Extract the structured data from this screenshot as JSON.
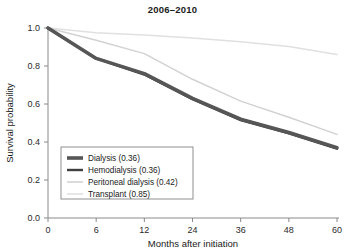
{
  "chart_data": {
    "type": "line",
    "title": "2006–2010",
    "xlabel": "Months after initiation",
    "ylabel": "Survival probability",
    "x": [
      0,
      6,
      12,
      24,
      36,
      48,
      60
    ],
    "xticklabels": [
      "0",
      "6",
      "12",
      "24",
      "36",
      "48",
      "60"
    ],
    "yticklabels": [
      "0.0",
      "0.2",
      "0.4",
      "0.6",
      "0.8",
      "1.0"
    ],
    "yticks": [
      0.0,
      0.2,
      0.4,
      0.6,
      0.8,
      1.0
    ],
    "ylim": [
      0.0,
      1.0
    ],
    "xlim": [
      0,
      60
    ],
    "x_axis_scale": "categorical-even-spacing",
    "grid": false,
    "legend_position": "lower-left-inside",
    "series": [
      {
        "name": "Dialysis",
        "final_value": 0.36,
        "legend_label": "Dialysis (0.36)",
        "color": "#565656",
        "width": 3.6,
        "values": [
          1.0,
          0.84,
          0.76,
          0.63,
          0.52,
          0.45,
          0.37
        ]
      },
      {
        "name": "Hemodialysis",
        "final_value": 0.36,
        "legend_label": "Hemodialysis (0.36)",
        "color": "#3f3f3f",
        "width": 2.4,
        "values": [
          1.0,
          0.84,
          0.755,
          0.625,
          0.515,
          0.445,
          0.365
        ]
      },
      {
        "name": "Peritoneal dialysis",
        "final_value": 0.42,
        "legend_label": "Peritoneal dialysis (0.42)",
        "color": "#d2d2d2",
        "width": 1.5,
        "values": [
          1.0,
          0.935,
          0.865,
          0.73,
          0.615,
          0.53,
          0.44
        ]
      },
      {
        "name": "Transplant",
        "final_value": 0.85,
        "legend_label": "Transplant (0.85)",
        "color": "#e0e0e0",
        "width": 1.5,
        "values": [
          1.0,
          0.975,
          0.963,
          0.947,
          0.928,
          0.903,
          0.86
        ]
      }
    ]
  },
  "colors": {
    "axis": "#8a8a8a",
    "text": "#1a1a1a",
    "background": "#ffffff",
    "legend_border": "#8f8f8f"
  }
}
